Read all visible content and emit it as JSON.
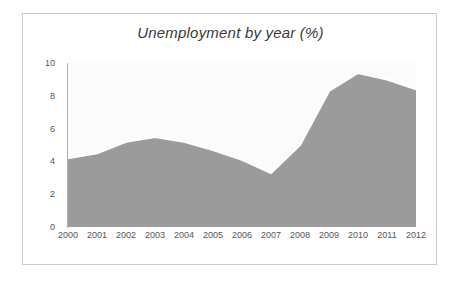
{
  "chart_data": {
    "type": "area",
    "title": "Unemployment by year (%)",
    "xlabel": "",
    "ylabel": "",
    "categories": [
      "2000",
      "2001",
      "2002",
      "2003",
      "2004",
      "2005",
      "2006",
      "2007",
      "2008",
      "2009",
      "2010",
      "2011",
      "2012"
    ],
    "values": [
      4.2,
      4.5,
      5.2,
      5.5,
      5.2,
      4.7,
      4.1,
      3.3,
      5.0,
      8.3,
      9.4,
      9.0,
      8.4
    ],
    "series": [
      {
        "name": "Unemployment",
        "values": [
          4.2,
          4.5,
          5.2,
          5.5,
          5.2,
          4.7,
          4.1,
          3.3,
          5.0,
          8.3,
          9.4,
          9.0,
          8.4
        ]
      }
    ],
    "ylim": [
      0,
      10
    ],
    "yticks": [
      0,
      2,
      4,
      6,
      8,
      10
    ],
    "ytick_labels": [
      "0",
      "2",
      "4",
      "6",
      "8",
      "10"
    ],
    "xticks": [
      "2000",
      "2001",
      "2002",
      "2003",
      "2004",
      "2005",
      "2006",
      "2007",
      "2008",
      "2009",
      "2010",
      "2011",
      "2012"
    ],
    "grid": false,
    "legend": "none",
    "colors": {
      "area_fill": "#9b9b9b",
      "line": "#ffffff",
      "plot_background": "#fbfbfb",
      "axis": "#b0b0b0",
      "tick_text": "#555555",
      "title_text": "#3a3a3a",
      "frame_border": "#c9c9c9",
      "page_background": "#ffffff"
    }
  }
}
